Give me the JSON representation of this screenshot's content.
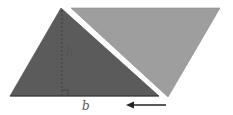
{
  "figure": {
    "labels": {
      "height": "h",
      "base": "b"
    },
    "colors": {
      "background": "#ffffff",
      "dark_triangle": "#5b5b5b",
      "light_triangle": "#9e9e9e",
      "height_line": "#3e3e3e",
      "base_line": "#333333",
      "arrow": "#222222",
      "label": "#555555"
    },
    "shapes": {
      "dark_triangle_points": "10,96 61,8 159,96",
      "light_triangle_points": "71,8 220,8 168,97",
      "height_line": {
        "x": 62,
        "y1": 10,
        "y2": 96
      },
      "right_angle_marker": "62,90 68,90 68,96",
      "arrow": {
        "x1": 166,
        "x2": 127,
        "y": 105,
        "direction": "left"
      }
    }
  }
}
